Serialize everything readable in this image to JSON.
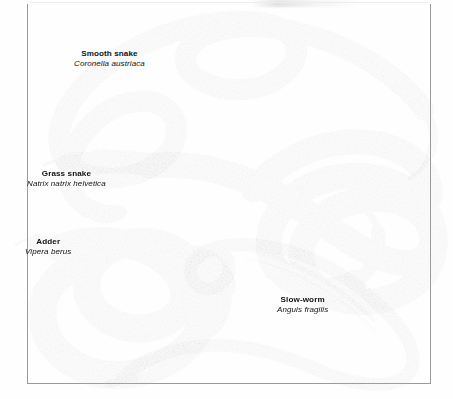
{
  "plate": {
    "title": "British snakes and slow-worm plate",
    "medium": "halftone scan, grayscale",
    "background_color": "#fefefe",
    "frame_color": "#9a9a9a",
    "text_color": "#121212"
  },
  "specimens": [
    {
      "id": "smooth-snake",
      "common_name": "Smooth snake",
      "latin_name": "Coronella austriaca",
      "body_tone": "#d8d4cd",
      "marking": "rows of small dark speckles",
      "label_position": "upper-left-of-centre"
    },
    {
      "id": "grass-snake",
      "common_name": "Grass snake",
      "latin_name": "Natrix natrix helvetica",
      "body_tone": "#a8a49c",
      "marking": "short black bars and flecks along flanks",
      "label_position": "mid-left"
    },
    {
      "id": "adder",
      "common_name": "Adder",
      "latin_name": "Vipera berus",
      "body_tone": "#6f6a62",
      "marking": "bold dark zigzag dorsal stripe",
      "label_position": "lower-left"
    },
    {
      "id": "slow-worm",
      "common_name": "Slow-worm",
      "latin_name": "Anguis fragilis",
      "body_tone": "#7d7870",
      "marking": "smooth unmarked glossy body",
      "label_position": "lower-right-of-centre"
    }
  ]
}
